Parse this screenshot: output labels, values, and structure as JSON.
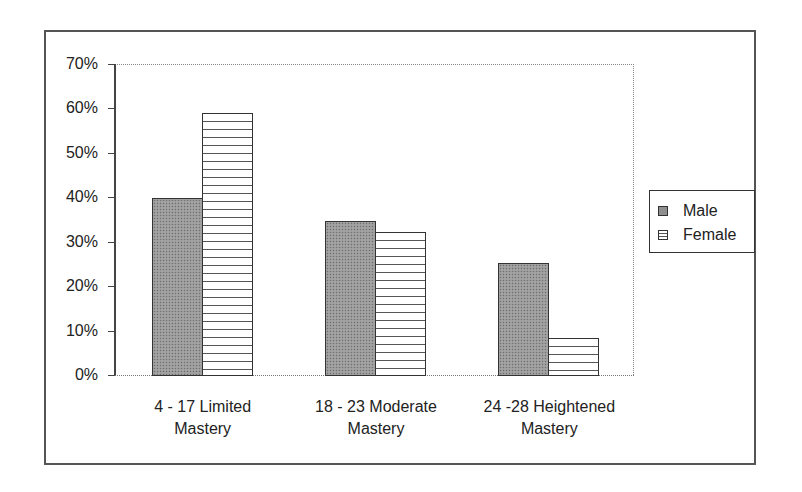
{
  "chart_data": {
    "type": "bar",
    "title": "",
    "xlabel": "",
    "ylabel": "",
    "ylim": [
      0,
      70
    ],
    "yticks": [
      "0%",
      "10%",
      "20%",
      "30%",
      "40%",
      "50%",
      "60%",
      "70%"
    ],
    "grid": false,
    "legend_position": "right",
    "categories": [
      "4 - 17 Limited Mastery",
      "18 - 23 Moderate Mastery",
      "24 -28 Heightened Mastery"
    ],
    "category_lines": [
      [
        "4 - 17 Limited",
        "Mastery"
      ],
      [
        "18 - 23 Moderate",
        "Mastery"
      ],
      [
        "24 -28 Heightened",
        "Mastery"
      ]
    ],
    "series": [
      {
        "name": "Male",
        "values": [
          39.8,
          34.7,
          25.2
        ],
        "pattern": "dotted-gray",
        "color": "#9a9a9a"
      },
      {
        "name": "Female",
        "values": [
          59.0,
          32.2,
          8.3
        ],
        "pattern": "horizontal-lines",
        "color": "#ffffff"
      }
    ]
  },
  "legend": {
    "items": [
      {
        "label": "Male"
      },
      {
        "label": "Female"
      }
    ]
  }
}
